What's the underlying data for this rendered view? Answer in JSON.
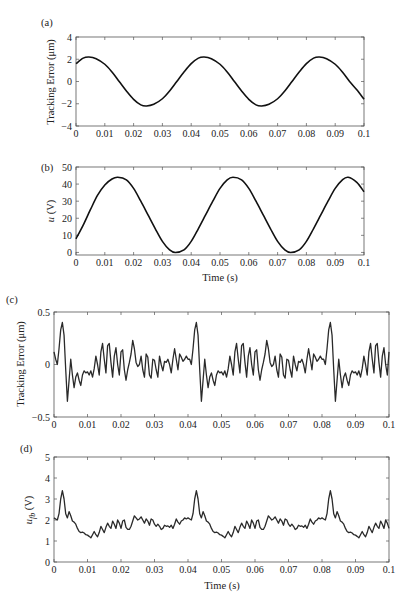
{
  "chart_data": [
    {
      "id": "a",
      "panel_label": "(a)",
      "type": "line",
      "title": "",
      "xlabel": "",
      "ylabel": "Tracking Error (μm)",
      "xlim": [
        0,
        0.1
      ],
      "ylim": [
        -4,
        4
      ],
      "xticks": [
        "0",
        "0.01",
        "0.02",
        "0.03",
        "0.04",
        "0.05",
        "0.06",
        "0.07",
        "0.08",
        "0.09",
        "0.1"
      ],
      "yticks": [
        "-4",
        "-2",
        "0",
        "2",
        "4"
      ],
      "grid": false,
      "series": [
        {
          "name": "tracking error",
          "x": [
            0,
            0.0025,
            0.0045,
            0.007,
            0.01,
            0.0125,
            0.015,
            0.0175,
            0.02,
            0.0225,
            0.0245,
            0.027,
            0.03,
            0.0325,
            0.035,
            0.0375,
            0.04,
            0.0425,
            0.0445,
            0.047,
            0.05,
            0.0525,
            0.055,
            0.0575,
            0.06,
            0.0625,
            0.0645,
            0.067,
            0.07,
            0.0725,
            0.075,
            0.0775,
            0.08,
            0.0825,
            0.0845,
            0.087,
            0.09,
            0.0925,
            0.095,
            0.0975,
            0.1
          ],
          "y": [
            1.6,
            2.1,
            2.2,
            2.05,
            1.55,
            0.85,
            0.0,
            -0.85,
            -1.6,
            -2.1,
            -2.2,
            -2.05,
            -1.55,
            -0.85,
            0.0,
            0.85,
            1.6,
            2.1,
            2.2,
            2.05,
            1.55,
            0.85,
            0.0,
            -0.85,
            -1.6,
            -2.1,
            -2.2,
            -2.05,
            -1.55,
            -0.85,
            0.0,
            0.85,
            1.6,
            2.1,
            2.2,
            2.05,
            1.55,
            0.85,
            0.0,
            -0.75,
            -1.6
          ]
        }
      ]
    },
    {
      "id": "b",
      "panel_label": "(b)",
      "type": "line",
      "title": "",
      "xlabel": "Time (s)",
      "ylabel": "u (V)",
      "xlim": [
        0,
        0.1
      ],
      "ylim": [
        -1.5,
        50
      ],
      "xticks": [
        "0",
        "0.01",
        "0.02",
        "0.03",
        "0.04",
        "0.05",
        "0.06",
        "0.07",
        "0.08",
        "0.09",
        "0.1"
      ],
      "yticks": [
        "0",
        "10",
        "20",
        "30",
        "40",
        "50"
      ],
      "grid": false,
      "series": [
        {
          "name": "control input u",
          "x": [
            0,
            0.0025,
            0.005,
            0.0075,
            0.01,
            0.0125,
            0.0145,
            0.0175,
            0.02,
            0.0225,
            0.025,
            0.0275,
            0.03,
            0.0325,
            0.0345,
            0.0375,
            0.04,
            0.0425,
            0.045,
            0.0475,
            0.05,
            0.0525,
            0.0545,
            0.0575,
            0.06,
            0.0625,
            0.065,
            0.0675,
            0.07,
            0.0725,
            0.0745,
            0.0775,
            0.08,
            0.0825,
            0.085,
            0.0875,
            0.09,
            0.0925,
            0.0945,
            0.0975,
            0.1
          ],
          "y": [
            8,
            16,
            25,
            33.5,
            39.5,
            43,
            44,
            42.5,
            37.5,
            30,
            22,
            14,
            6.5,
            1.5,
            0,
            1.5,
            6.5,
            14,
            22,
            30,
            37.5,
            42.5,
            44,
            42.5,
            37.5,
            30,
            22,
            14,
            6.5,
            1.5,
            0,
            1.5,
            6.5,
            14,
            22,
            30,
            37.5,
            42.5,
            44,
            41,
            35.5
          ]
        }
      ]
    },
    {
      "id": "c",
      "panel_label": "(c)",
      "type": "line",
      "title": "",
      "xlabel": "",
      "ylabel": "Tracking Error (μm)",
      "xlim": [
        0,
        0.1
      ],
      "ylim": [
        -0.5,
        0.5
      ],
      "xticks": [
        "0",
        "0.01",
        "0.02",
        "0.03",
        "0.04",
        "0.05",
        "0.06",
        "0.07",
        "0.08",
        "0.09",
        "0.1"
      ],
      "yticks": [
        "-0.5",
        "0",
        "0.5"
      ],
      "grid": false,
      "series": [
        {
          "name": "tracking error with feedback",
          "x": [
            0,
            0.0005,
            0.001,
            0.0015,
            0.002,
            0.0025,
            0.003,
            0.0035,
            0.004,
            0.0045,
            0.005,
            0.0055,
            0.006,
            0.0065,
            0.007,
            0.0075,
            0.008,
            0.0085,
            0.009,
            0.0095,
            0.01,
            0.0105,
            0.011,
            0.0115,
            0.012,
            0.0125,
            0.013,
            0.0135,
            0.014,
            0.0145,
            0.015,
            0.0155,
            0.016,
            0.0165,
            0.017,
            0.0175,
            0.018,
            0.0185,
            0.019,
            0.0195,
            0.02,
            0.0205,
            0.021,
            0.0215,
            0.022,
            0.0225,
            0.023,
            0.0235,
            0.024,
            0.0245,
            0.025,
            0.0255,
            0.026,
            0.0265,
            0.027,
            0.0275,
            0.028,
            0.0285,
            0.029,
            0.0295,
            0.03,
            0.0305,
            0.031,
            0.0315,
            0.032,
            0.0325,
            0.033,
            0.0335,
            0.034,
            0.0345,
            0.035,
            0.0355,
            0.036,
            0.0365,
            0.037,
            0.0375,
            0.038,
            0.0385,
            0.039,
            0.0395,
            0.04
          ],
          "y": [
            0.12,
            0.05,
            0.0,
            0.15,
            0.33,
            0.4,
            0.28,
            -0.05,
            -0.35,
            -0.15,
            0.05,
            -0.1,
            -0.22,
            -0.12,
            -0.08,
            -0.15,
            -0.2,
            -0.1,
            -0.06,
            -0.08,
            -0.07,
            -0.1,
            -0.06,
            -0.12,
            -0.04,
            0.08,
            0.0,
            -0.1,
            0.12,
            0.2,
            0.05,
            -0.08,
            0.18,
            0.2,
            0.02,
            -0.12,
            0.08,
            0.16,
            0.0,
            -0.1,
            0.12,
            0.14,
            -0.05,
            -0.15,
            -0.05,
            0.02,
            0.1,
            0.23,
            0.15,
            0.02,
            -0.02,
            0.0,
            0.08,
            -0.05,
            -0.12,
            0.1,
            0.07,
            -0.1,
            -0.13,
            0.05,
            0.04,
            -0.05,
            -0.12,
            0.08,
            0.0,
            -0.06,
            0.03,
            0.02,
            0.05,
            0.0,
            -0.08,
            0.05,
            0.15,
            0.05,
            -0.05,
            0.1,
            0.07,
            0.03,
            0.05,
            0.08,
            0.05
          ]
        }
      ]
    },
    {
      "id": "d",
      "panel_label": "(d)",
      "type": "line",
      "title": "",
      "xlabel": "Time (s)",
      "ylabel": "u_fb (V)",
      "xlim": [
        0,
        0.1
      ],
      "ylim": [
        0,
        5
      ],
      "xticks": [
        "0",
        "0.01",
        "0.02",
        "0.03",
        "0.04",
        "0.05",
        "0.06",
        "0.07",
        "0.08",
        "0.09",
        "0.1"
      ],
      "yticks": [
        "0",
        "1",
        "2",
        "3",
        "4",
        "5"
      ],
      "grid": false,
      "series": [
        {
          "name": "feedback control input u_fb",
          "x": [
            0,
            0.0005,
            0.001,
            0.0015,
            0.002,
            0.0025,
            0.003,
            0.0035,
            0.004,
            0.0045,
            0.005,
            0.0055,
            0.006,
            0.0065,
            0.007,
            0.0075,
            0.008,
            0.0085,
            0.009,
            0.0095,
            0.01,
            0.0105,
            0.011,
            0.0115,
            0.012,
            0.0125,
            0.013,
            0.0135,
            0.014,
            0.0145,
            0.015,
            0.0155,
            0.016,
            0.0165,
            0.017,
            0.0175,
            0.018,
            0.0185,
            0.019,
            0.0195,
            0.02,
            0.0205,
            0.021,
            0.0215,
            0.022,
            0.0225,
            0.023,
            0.0235,
            0.024,
            0.0245,
            0.025,
            0.0255,
            0.026,
            0.0265,
            0.027,
            0.0275,
            0.028,
            0.0285,
            0.029,
            0.0295,
            0.03,
            0.0305,
            0.031,
            0.0315,
            0.032,
            0.0325,
            0.033,
            0.0335,
            0.034,
            0.0345,
            0.035,
            0.0355,
            0.036,
            0.0365,
            0.037,
            0.0375,
            0.038,
            0.0385,
            0.039,
            0.0395,
            0.04
          ],
          "y": [
            2.1,
            2.05,
            2.0,
            2.3,
            3.0,
            3.4,
            3.0,
            2.3,
            2.1,
            2.4,
            2.2,
            1.95,
            1.9,
            1.8,
            1.6,
            1.45,
            1.4,
            1.42,
            1.38,
            1.3,
            1.28,
            1.22,
            1.15,
            1.3,
            1.45,
            1.3,
            1.2,
            1.4,
            1.7,
            1.55,
            1.4,
            1.65,
            1.85,
            1.7,
            1.6,
            1.95,
            1.8,
            1.6,
            2.0,
            1.85,
            1.6,
            1.95,
            2.0,
            1.65,
            1.55,
            1.55,
            1.7,
            1.95,
            2.2,
            2.1,
            2.0,
            2.05,
            2.15,
            2.0,
            1.85,
            2.05,
            1.95,
            1.75,
            2.05,
            2.0,
            1.8,
            1.7,
            1.8,
            1.7,
            1.55,
            1.6,
            1.75,
            1.7,
            1.72,
            1.65,
            1.75,
            1.6,
            1.8,
            2.05,
            1.9,
            1.8,
            1.95,
            2.0,
            2.1,
            2.05,
            2.1
          ]
        }
      ]
    }
  ]
}
